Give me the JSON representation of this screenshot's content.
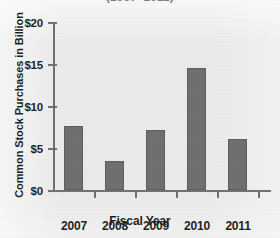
{
  "caption_fragment": "(2007–2011)",
  "chart_data": {
    "type": "bar",
    "title": "",
    "xlabel": "Fiscal Year",
    "ylabel": "Common Stock Purchases in Billion",
    "categories": [
      "2007",
      "2008",
      "2009",
      "2010",
      "2011"
    ],
    "values": [
      7.7,
      3.45,
      7.15,
      14.6,
      6.1
    ],
    "ylim": [
      0,
      20
    ],
    "ytick_values": [
      0,
      5,
      10,
      15,
      20
    ],
    "ytick_labels": [
      "$0",
      "$5",
      "$10",
      "$15",
      "$20"
    ],
    "grid": false,
    "legend": "none",
    "bar_color": "#6e6e6e",
    "axis_color": "#6f6f6f",
    "background_color": "#eaeaea"
  }
}
